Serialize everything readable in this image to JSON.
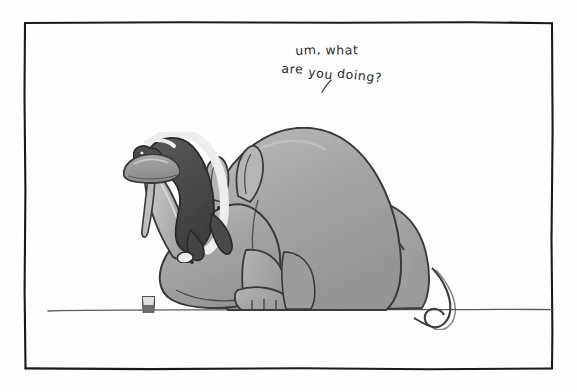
{
  "panel": {
    "width": 577,
    "height": 392,
    "background_color": "#fefefe",
    "border": {
      "name": "hand-drawn-frame",
      "color": "#1a1a1a",
      "inset_left": 24,
      "inset_top": 22,
      "inset_right": 24,
      "inset_bottom": 24,
      "stroke_width": 2.2
    }
  },
  "caption": {
    "full_text": "um, what are you doing?",
    "line_1": "um, what",
    "line_2": "are you doing?",
    "words_line_1": [
      "um,",
      "what"
    ],
    "words_line_2": [
      "are",
      "you",
      "doing?"
    ],
    "color": "#2b2b2b",
    "style": "handwritten",
    "pointer_mark": "speech-tick"
  },
  "scene": {
    "title": "Rhino and honey badger cartoon",
    "ground_line": {
      "name": "ground-line",
      "color": "#555555",
      "y": 310,
      "x_start": 48,
      "x_end": 553
    },
    "characters": [
      {
        "name": "rhinoceros",
        "pose": "sitting, facing left",
        "body_color": "#a6a6a6",
        "shade_color": "#8e8e8e",
        "highlight_color": "#c4c4c4",
        "outline_color": "#3a3a3a",
        "features": [
          "two pointed ears",
          "large front horn",
          "small second horn",
          "eye dot",
          "nostril dot",
          "curling tufted tail",
          "four toed feet"
        ]
      },
      {
        "name": "honey-badger",
        "pose": "perched on rhino horn, reaching for mushroom",
        "body_color": "#4a4a4a",
        "stripe_color": "#f2f2f2",
        "outline_color": "#2a2a2a"
      }
    ],
    "objects": [
      {
        "name": "mushroom",
        "description": "mushroom cap balanced on the tip of the rhino horn",
        "cap_color": "#9a9a9a",
        "stem_color": "#bcbcbc"
      },
      {
        "name": "drinking-glass",
        "description": "small glass with liquid resting on the ground",
        "x": 148,
        "y": 305,
        "glass_color": "#d8d8d8",
        "liquid_color": "#6f6f6f",
        "outline_color": "#4a4a4a"
      }
    ]
  }
}
